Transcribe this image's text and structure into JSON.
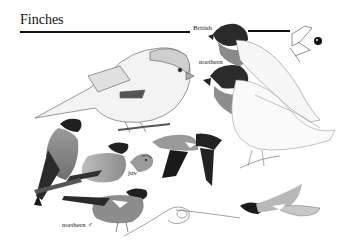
{
  "page": {
    "title": "Finches",
    "labels": {
      "british": "British",
      "northern_top": "northern",
      "juv": "juv",
      "northern_male": "northern ♂"
    }
  },
  "illustrations": [
    {
      "name": "bullfinch-large-perched-female",
      "position": "top-left"
    },
    {
      "name": "bullfinch-head-british",
      "position": "top-right"
    },
    {
      "name": "bill-detail-sketch",
      "position": "top-right-corner"
    },
    {
      "name": "eye-detail",
      "position": "top-right-corner"
    },
    {
      "name": "bullfinch-northern-perched-large",
      "position": "right"
    },
    {
      "name": "bullfinch-male-perched",
      "position": "left"
    },
    {
      "name": "bullfinch-female-perched",
      "position": "left-center"
    },
    {
      "name": "bullfinch-juvenile-head",
      "position": "center"
    },
    {
      "name": "bullfinch-flying-male",
      "position": "center-right"
    },
    {
      "name": "bullfinch-northern-male-perched",
      "position": "bottom-left"
    },
    {
      "name": "bullfinch-flying-sketch",
      "position": "bottom-center"
    },
    {
      "name": "bullfinch-flying-female",
      "position": "bottom-right"
    }
  ],
  "colors": {
    "ink": "#111111",
    "cap": "#1a1a1a",
    "breast_grey": "#8a8a8a",
    "back_grey": "#a9a9a9",
    "paper": "#ffffff"
  }
}
